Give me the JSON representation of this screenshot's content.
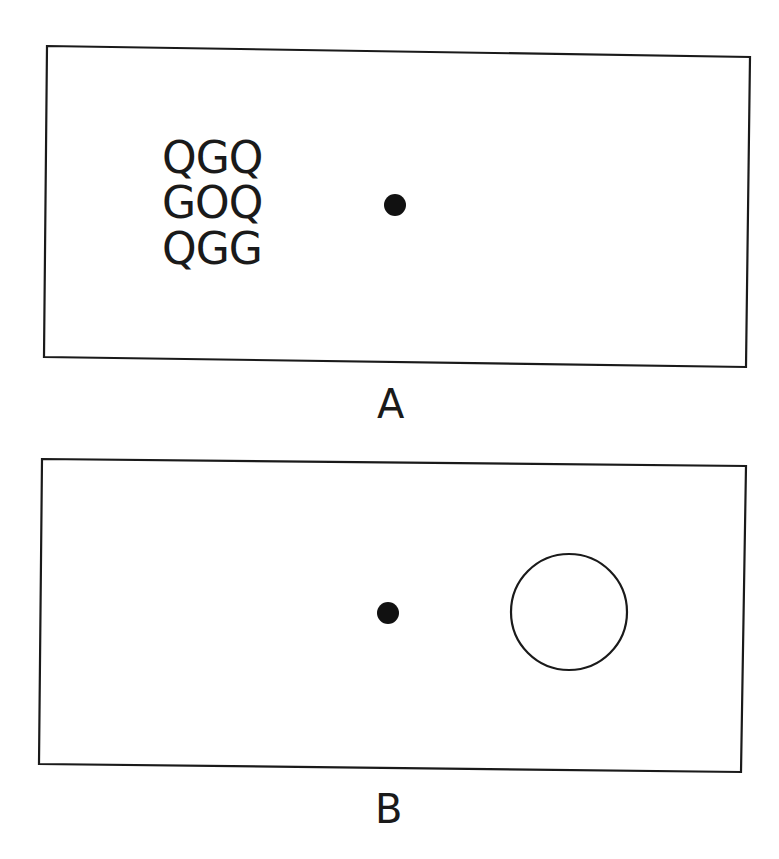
{
  "panels": [
    {
      "id": "A",
      "label": "A",
      "letter_grid": [
        "QGQ",
        "GOQ",
        "QGG"
      ],
      "fixation_dot": {
        "cx": 395,
        "cy": 205,
        "r": 11
      },
      "colors": {
        "stroke": "#1a1a1a",
        "dot": "#111111",
        "background": "#ffffff"
      }
    },
    {
      "id": "B",
      "label": "B",
      "fixation_dot": {
        "cx": 388,
        "cy": 613,
        "r": 11
      },
      "open_circle": {
        "cx": 569,
        "cy": 612,
        "r": 58
      },
      "colors": {
        "stroke": "#1a1a1a",
        "dot": "#111111",
        "background": "#ffffff"
      }
    }
  ]
}
